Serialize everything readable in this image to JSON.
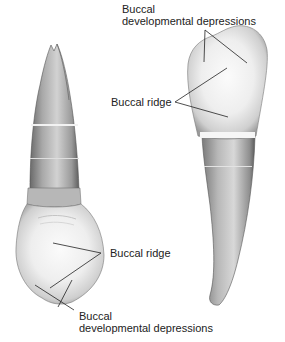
{
  "figure": {
    "type": "dental anatomy illustration",
    "views": [
      {
        "name": "left-tooth",
        "description": "Tooth viewed with crown at bottom, root pointing up"
      },
      {
        "name": "right-tooth",
        "description": "Tooth viewed with crown at top, root pointing down"
      }
    ]
  },
  "labels": {
    "top_depressions": {
      "line1": "Buccal",
      "line2": "developmental depressions"
    },
    "right_ridge": "Buccal ridge",
    "left_ridge": "Buccal ridge",
    "bottom_depressions": {
      "line1": "Buccal",
      "line2": "developmental depressions"
    }
  },
  "colors": {
    "line": "#222222",
    "text": "#222222",
    "tooth_light": "#f4f4f4",
    "tooth_mid": "#bdbdbd",
    "tooth_dark": "#6e6e6e"
  }
}
